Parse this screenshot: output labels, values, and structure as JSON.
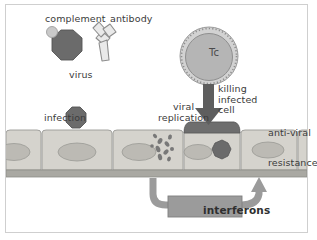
{
  "figure": {
    "background_color": "#ffffff",
    "frame_color": "#cfcfcf"
  },
  "colors": {
    "virus_dark": "#6b6b6b",
    "complement_light": "#c9c9c9",
    "antibody_fill": "#e8e8e8",
    "antibody_stroke": "#8d8d8d",
    "tc_cytoplasm": "#b5b5b5",
    "tc_membrane": "#d2d2d2",
    "tc_stroke": "#8f8f8f",
    "epithelium_fill": "#d5d3cd",
    "epithelium_stroke": "#9a9a96",
    "nucleus_fill": "#b9b8b2",
    "basement_membrane": "#a9a8a2",
    "infected_cap": "#6e6e6e",
    "arrow_dark": "#5e5e5e",
    "interferon_box": "#9b9b9b",
    "interferon_arrow": "#9b9b9b"
  },
  "labels": {
    "complement": "complement",
    "antibody": "antibody",
    "virus": "virus",
    "infection": "infection",
    "viral_replication_line1": "viral",
    "viral_replication_line2": "replication",
    "killing_line1": "killing",
    "killing_line2": "infected",
    "killing_line3": "cell",
    "tc_cell": "Tc",
    "anti_viral": "anti-viral",
    "resistance": "resistance",
    "interferons": "interferons"
  },
  "elements": {
    "complement_particle": "complement-protein-dot",
    "virus_particle": "virus-octagon",
    "antibody_molecule": "antibody-y-shape",
    "tc_lymphocyte": "cytotoxic-t-cell",
    "killing_arrow": "downward-arrow",
    "interferon_arrow": "curved-feedback-arrow",
    "replicating_virus": "viral-particles-cluster"
  },
  "epithelium": {
    "cell_count": 6,
    "cells": [
      {
        "id": "cell-1",
        "state": "normal"
      },
      {
        "id": "cell-2",
        "state": "infected-entry"
      },
      {
        "id": "cell-3",
        "state": "replicating"
      },
      {
        "id": "cell-4",
        "state": "infected-targeted"
      },
      {
        "id": "cell-5",
        "state": "anti-viral-resistant"
      },
      {
        "id": "cell-6",
        "state": "normal"
      }
    ]
  }
}
